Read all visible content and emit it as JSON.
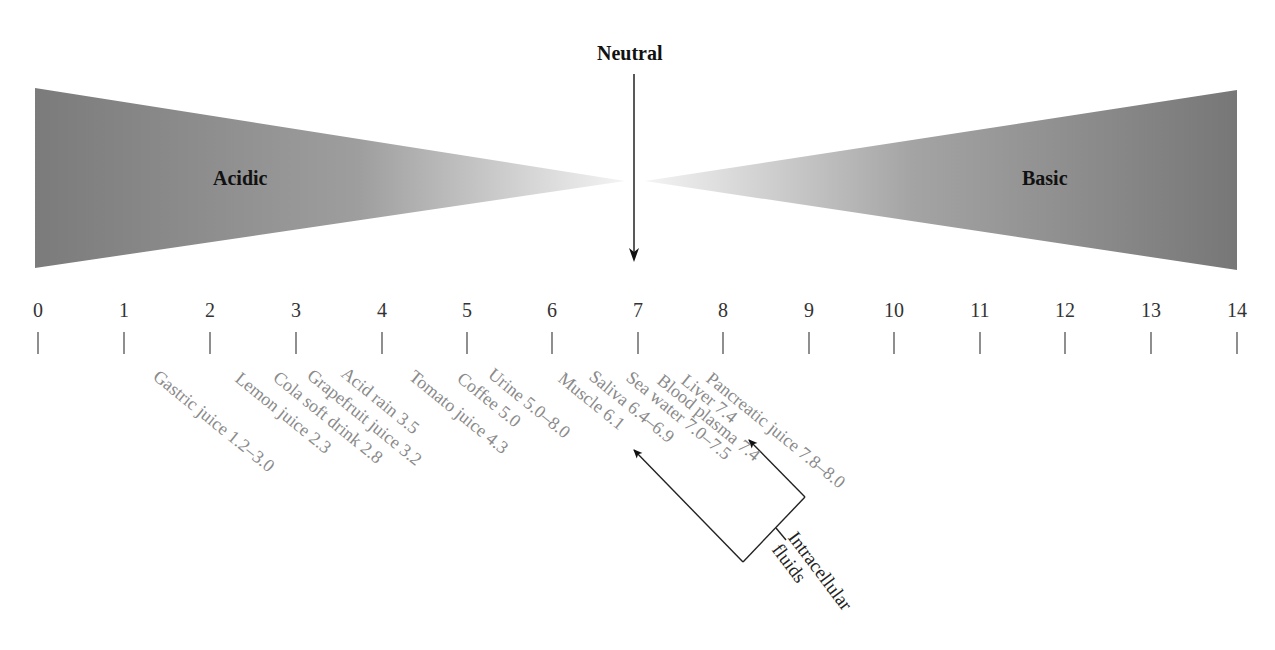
{
  "labels": {
    "neutral": "Neutral",
    "acidic": "Acidic",
    "basic": "Basic",
    "intracellular_line1": "Intracellular",
    "intracellular_line2": "fluids"
  },
  "colors": {
    "wedge_dark": "#7a7a7a",
    "wedge_light": "#f2f2f2",
    "sample_text": "#8a8a8a",
    "axis": "#333333"
  },
  "scale": {
    "min": 0,
    "max": 14,
    "ticks": [
      "0",
      "1",
      "2",
      "3",
      "4",
      "5",
      "6",
      "7",
      "8",
      "9",
      "10",
      "11",
      "12",
      "13",
      "14"
    ]
  },
  "samples": [
    {
      "label": "Gastric juice 1.2–3.0"
    },
    {
      "label": "Lemon juice 2.3"
    },
    {
      "label": "Cola soft drink 2.8"
    },
    {
      "label": "Grapefruit juice 3.2"
    },
    {
      "label": "Acid rain 3.5"
    },
    {
      "label": "Tomato juice 4.3"
    },
    {
      "label": "Coffee 5.0"
    },
    {
      "label": "Urine 5.0–8.0"
    },
    {
      "label": "Muscle 6.1"
    },
    {
      "label": "Saliva 6.4–6.9"
    },
    {
      "label": "Sea water 7.0–7.5"
    },
    {
      "label": "Blood plasma 7.4"
    },
    {
      "label": "Liver 7.4"
    },
    {
      "label": "Pancreatic juice 7.8–8.0"
    }
  ]
}
